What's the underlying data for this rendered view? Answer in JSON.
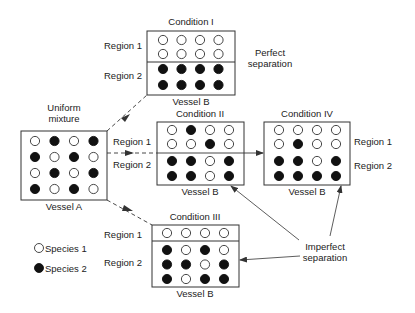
{
  "diagram": {
    "colors": {
      "line": "#333333",
      "species1_fill": "#ffffff",
      "species2_fill": "#111111"
    },
    "vessel_a": {
      "title": "Uniform mixture",
      "title_lines": [
        "Uniform",
        "mixture"
      ],
      "caption": "Vessel A",
      "grid": [
        [
          1,
          2,
          1,
          2
        ],
        [
          2,
          1,
          2,
          1
        ],
        [
          1,
          2,
          1,
          2
        ],
        [
          2,
          1,
          2,
          1
        ]
      ]
    },
    "conditions": [
      {
        "id": "I",
        "title": "Condition I",
        "caption": "Vessel B",
        "region1_label": "Region 1",
        "region2_label": "Region 2",
        "region1": [
          [
            1,
            1,
            1,
            1
          ],
          [
            1,
            1,
            1,
            1
          ]
        ],
        "region2": [
          [
            2,
            2,
            2,
            2
          ],
          [
            2,
            2,
            2,
            2
          ]
        ],
        "note_lines": [
          "Perfect",
          "separation"
        ]
      },
      {
        "id": "II",
        "title": "Condition II",
        "caption": "Vessel B",
        "region1_label": "Region 1",
        "region2_label": "Region 2",
        "region1": [
          [
            1,
            2,
            1,
            1
          ],
          [
            1,
            1,
            2,
            1
          ]
        ],
        "region2": [
          [
            2,
            2,
            1,
            2
          ],
          [
            2,
            2,
            1,
            2
          ]
        ]
      },
      {
        "id": "III",
        "title": "Condition III",
        "caption": "Vessel B",
        "region1_label": "Region 1",
        "region2_label": "Region 2",
        "region1": [
          [
            1,
            1,
            1,
            1
          ]
        ],
        "region2": [
          [
            2,
            1,
            2,
            1
          ],
          [
            2,
            2,
            1,
            2
          ],
          [
            2,
            1,
            2,
            2
          ]
        ]
      },
      {
        "id": "IV",
        "title": "Condition IV",
        "caption": "Vessel B",
        "region1_label": "Region 1",
        "region2_label": "Region 2",
        "region1": [
          [
            1,
            1,
            1,
            1
          ],
          [
            1,
            2,
            1,
            1
          ]
        ],
        "region2": [
          [
            2,
            2,
            1,
            2
          ],
          [
            2,
            2,
            2,
            2
          ]
        ]
      }
    ],
    "imperfect_note_lines": [
      "Imperfect",
      "separation"
    ],
    "legend": [
      {
        "symbol": "open-circle",
        "label": "Species 1"
      },
      {
        "symbol": "filled-circle",
        "label": "Species 2"
      }
    ]
  }
}
